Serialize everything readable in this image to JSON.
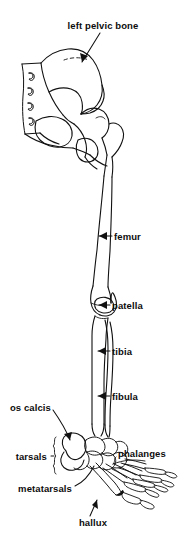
{
  "figure": {
    "kind": "anatomical-line-drawing",
    "background_color": "#ffffff",
    "ink_color": "#111111",
    "width": 178,
    "height": 544
  },
  "cropped_header": {
    "visible": true,
    "text": ""
  },
  "labels": [
    {
      "id": "left-pelvic-bone",
      "text": "left pelvic bone",
      "x": 103,
      "y": 25,
      "align": "center",
      "leader": "arrow",
      "points_to": "ilium"
    },
    {
      "id": "femur",
      "text": "femur",
      "x": 114,
      "y": 236,
      "align": "left",
      "leader": "arrow",
      "points_to": "femoral shaft"
    },
    {
      "id": "patella",
      "text": "patella",
      "x": 112,
      "y": 305,
      "align": "left",
      "leader": "arrow",
      "points_to": "kneecap"
    },
    {
      "id": "tibia",
      "text": "tibia",
      "x": 112,
      "y": 351,
      "align": "left",
      "leader": "arrow",
      "points_to": "tibial shaft"
    },
    {
      "id": "fibula",
      "text": "fibula",
      "x": 112,
      "y": 396,
      "align": "left",
      "leader": "arrow",
      "points_to": "fibular shaft"
    },
    {
      "id": "os-calcis",
      "text": "os calcis",
      "x": 51,
      "y": 407,
      "align": "right",
      "leader": "line",
      "points_to": "calcaneus"
    },
    {
      "id": "tarsals",
      "text": "tarsals",
      "x": 47,
      "y": 456,
      "align": "right",
      "leader": "brace",
      "points_to": "tarsal bones"
    },
    {
      "id": "phalanges",
      "text": "phalanges",
      "x": 118,
      "y": 453,
      "align": "left",
      "leader": "brace",
      "points_to": "toe bones"
    },
    {
      "id": "metatarsals",
      "text": "metatarsals",
      "x": 72,
      "y": 488,
      "align": "right",
      "leader": "curve",
      "points_to": "metatarsal bones"
    },
    {
      "id": "hallux",
      "text": "hallux",
      "x": 93,
      "y": 522,
      "align": "center",
      "leader": "arrow",
      "points_to": "great toe"
    }
  ]
}
